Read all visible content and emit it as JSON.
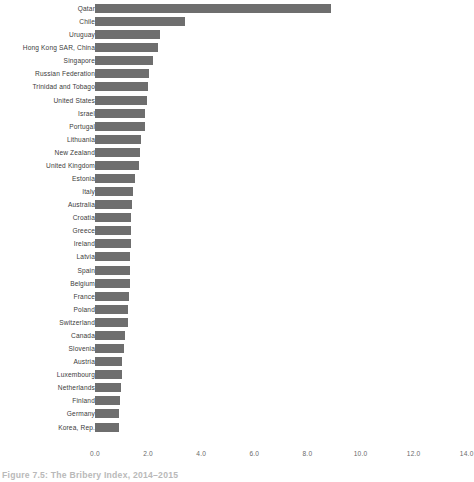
{
  "caption": "Figure 7.5: The Bribery Index, 2014–2015",
  "colors": {
    "bar": "#6e6e6e",
    "label_text": "#3b3b3b",
    "tick_text": "#6a6a6a",
    "background": "#ffffff"
  },
  "chart_data": {
    "type": "bar",
    "orientation": "horizontal",
    "title": "",
    "subtitle": "",
    "xlabel": "",
    "ylabel": "",
    "xlim": [
      0.0,
      14.0
    ],
    "grid": false,
    "legend": null,
    "xticks": [
      "0.0",
      "2.0",
      "4.0",
      "6.0",
      "8.0",
      "10.0",
      "12.0",
      "14.0"
    ],
    "xtick_values": [
      0.0,
      2.0,
      4.0,
      6.0,
      8.0,
      10.0,
      12.0,
      14.0
    ],
    "categories": [
      "Qatar",
      "Chile",
      "Uruguay",
      "Hong Kong SAR, China",
      "Singapore",
      "Russian Federation",
      "Trinidad and Tobago",
      "United States",
      "Israel",
      "Portugal",
      "Lithuania",
      "New Zealand",
      "United Kingdom",
      "Estonia",
      "Italy",
      "Australia",
      "Croatia",
      "Greece",
      "Ireland",
      "Latvia",
      "Spain",
      "Belgium",
      "France",
      "Poland",
      "Switzerland",
      "Canada",
      "Slovenia",
      "Austria",
      "Luxembourg",
      "Netherlands",
      "Finland",
      "Germany",
      "Korea, Rep."
    ],
    "values": [
      8.9,
      3.4,
      2.45,
      2.38,
      2.2,
      2.05,
      2.0,
      1.97,
      1.9,
      1.88,
      1.72,
      1.68,
      1.65,
      1.5,
      1.45,
      1.38,
      1.36,
      1.35,
      1.34,
      1.33,
      1.32,
      1.3,
      1.28,
      1.26,
      1.24,
      1.12,
      1.1,
      1.02,
      1.0,
      0.99,
      0.93,
      0.92,
      0.9
    ]
  }
}
